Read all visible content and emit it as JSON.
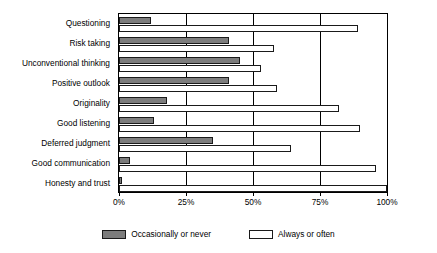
{
  "chart_data": {
    "type": "bar",
    "orientation": "horizontal",
    "title": "",
    "subtitle": "",
    "xlabel": "",
    "ylabel": "",
    "xlim": [
      0,
      100
    ],
    "xticks": [
      0,
      25,
      50,
      75,
      100
    ],
    "xticklabels": [
      "0%",
      "25%",
      "50%",
      "75%",
      "100%"
    ],
    "grid": true,
    "grid_axis": "x",
    "legend_position": "bottom",
    "categories": [
      "Questioning",
      "Risk taking",
      "Unconventional thinking",
      "Positive outlook",
      "Originality",
      "Good listening",
      "Deferred judgment",
      "Good communication",
      "Honesty and trust"
    ],
    "series": [
      {
        "name": "Occasionally or never",
        "color": "#7c7c7c",
        "values": [
          12,
          41,
          45,
          41,
          18,
          13,
          35,
          4,
          1
        ]
      },
      {
        "name": "Always or often",
        "color": "#ffffff",
        "values": [
          89,
          58,
          53,
          59,
          82,
          90,
          64,
          96,
          100
        ]
      }
    ]
  },
  "legend": {
    "items": [
      {
        "label": "Occasionally or never",
        "swatch": "dark"
      },
      {
        "label": "Always or often",
        "swatch": "light"
      }
    ]
  },
  "colors": {
    "dark_fill": "#7c7c7c",
    "light_fill": "#ffffff",
    "outline": "#1a1a1a",
    "axis": "#000000",
    "background": "#ffffff"
  }
}
